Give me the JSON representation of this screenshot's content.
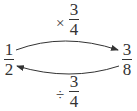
{
  "diagram": {
    "left_value": {
      "numerator": "1",
      "denominator": "2"
    },
    "right_value": {
      "numerator": "3",
      "denominator": "8"
    },
    "top_operation": {
      "operator": "×",
      "numerator": "3",
      "denominator": "4",
      "direction": "left-to-right"
    },
    "bottom_operation": {
      "operator": "÷",
      "numerator": "3",
      "denominator": "4",
      "direction": "right-to-left"
    },
    "colors": {
      "ink": "#333333",
      "background": "#ffffff"
    }
  }
}
